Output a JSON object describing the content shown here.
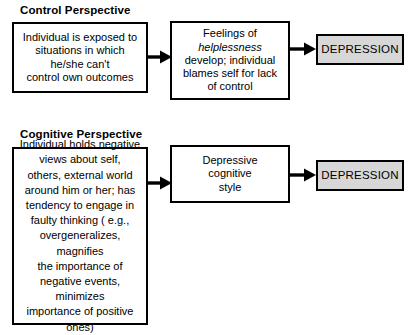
{
  "diagram": {
    "title_a": "Control Perspective",
    "title_b": "Cognitive Perspective",
    "sections": [
      {
        "id": "control-perspective",
        "heading": "Control Perspective",
        "nodes": [
          {
            "id": "control-cause",
            "role": "cause",
            "text": "Individual is exposed to\nsituations in which\nhe/she can't\ncontrol own outcomes"
          },
          {
            "id": "control-mediator",
            "role": "mediator",
            "text_before": "Feelings of\n",
            "text_emphasis": "helplessness",
            "text_after": "\ndevelop; individual\nblames self for lack\nof control",
            "emphasis_style": "italic"
          },
          {
            "id": "control-outcome",
            "role": "outcome",
            "text": "DEPRESSION",
            "fill": "#d7d7d7"
          }
        ],
        "arrows": [
          {
            "id": "arrow-control-1",
            "from": "control-cause",
            "to": "control-mediator"
          },
          {
            "id": "arrow-control-2",
            "from": "control-mediator",
            "to": "control-outcome"
          }
        ]
      },
      {
        "id": "cognitive-perspective",
        "heading": "Cognitive Perspective",
        "nodes": [
          {
            "id": "cognitive-cause",
            "role": "cause",
            "text": "Individual holds negative\nviews about self,\nothers, external world\naround him or her; has\ntendency to engage in\nfaulty thinking ( e.g.,\novergeneralizes,\nmagnifies\nthe importance of\nnegative events,\nminimizes\nimportance of positive\nones)"
          },
          {
            "id": "cognitive-mediator",
            "role": "mediator",
            "text": "Depressive\ncognitive\nstyle"
          },
          {
            "id": "cognitive-outcome",
            "role": "outcome",
            "text": "DEPRESSION",
            "fill": "#d7d7d7"
          }
        ],
        "arrows": [
          {
            "id": "arrow-cognitive-1",
            "from": "cognitive-cause",
            "to": "cognitive-mediator"
          },
          {
            "id": "arrow-cognitive-2",
            "from": "cognitive-mediator",
            "to": "cognitive-outcome"
          }
        ]
      }
    ],
    "colors": {
      "stroke": "#000000",
      "background": "#ffffff",
      "outcome_fill": "#d7d7d7"
    }
  }
}
